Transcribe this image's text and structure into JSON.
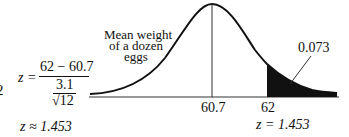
{
  "left_edge_fragment": "2",
  "formula": {
    "lhs": "z =",
    "numerator": "62 − 60.7",
    "denominator_top": "3.1",
    "denominator_radical": "√12",
    "result": "z ≈ 1.453"
  },
  "curve_label": {
    "line1": "Mean weight",
    "line2": "of a dozen",
    "line3": "eggs"
  },
  "area_label": "0.073",
  "axis": {
    "mean_tick": "60.7",
    "value_tick": "62",
    "z_label": "z = 1.453"
  },
  "colors": {
    "ink": "#111111",
    "background": "#ffffff"
  }
}
